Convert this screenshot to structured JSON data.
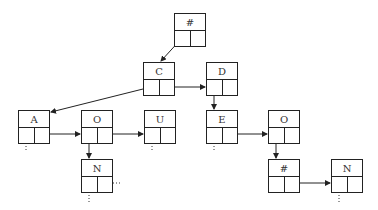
{
  "diagram": {
    "type": "trie-linked-list",
    "nodes": [
      {
        "id": "root",
        "label": "#",
        "x": 174,
        "y": 13,
        "left": "pointer",
        "right": "null"
      },
      {
        "id": "C",
        "label": "C",
        "x": 143,
        "y": 62,
        "left": "pointer",
        "right": "pointer"
      },
      {
        "id": "D",
        "label": "D",
        "x": 206,
        "y": 62,
        "left": "pointer",
        "right": "null"
      },
      {
        "id": "A",
        "label": "A",
        "x": 18,
        "y": 110,
        "left": "dotted",
        "right": "pointer"
      },
      {
        "id": "O1",
        "label": "O",
        "x": 81,
        "y": 110,
        "left": "pointer",
        "right": "pointer"
      },
      {
        "id": "U",
        "label": "U",
        "x": 144,
        "y": 110,
        "left": "dotted",
        "right": "null"
      },
      {
        "id": "E",
        "label": "E",
        "x": 206,
        "y": 110,
        "left": "dotted",
        "right": "pointer"
      },
      {
        "id": "O2",
        "label": "O",
        "x": 268,
        "y": 110,
        "left": "pointer",
        "right": "null"
      },
      {
        "id": "N1",
        "label": "N",
        "x": 81,
        "y": 159,
        "left": "dotted",
        "right": "dotted"
      },
      {
        "id": "hash2",
        "label": "#",
        "x": 268,
        "y": 159,
        "left": "null",
        "right": "pointer"
      },
      {
        "id": "N2",
        "label": "N",
        "x": 331,
        "y": 159,
        "left": "dotted",
        "right": "null"
      }
    ],
    "labels": {
      "root": "#",
      "C": "C",
      "D": "D",
      "A": "A",
      "O1": "O",
      "U": "U",
      "E": "E",
      "O2": "O",
      "N1": "N",
      "hash2": "#",
      "N2": "N"
    },
    "edges": [
      {
        "from": "root",
        "to": "C",
        "type": "child"
      },
      {
        "from": "C",
        "to": "A",
        "type": "child"
      },
      {
        "from": "C",
        "to": "D",
        "type": "sibling"
      },
      {
        "from": "D",
        "to": "E",
        "type": "child"
      },
      {
        "from": "A",
        "to": "O1",
        "type": "sibling"
      },
      {
        "from": "O1",
        "to": "U",
        "type": "sibling"
      },
      {
        "from": "O1",
        "to": "N1",
        "type": "child"
      },
      {
        "from": "E",
        "to": "O2",
        "type": "sibling"
      },
      {
        "from": "O2",
        "to": "hash2",
        "type": "child"
      },
      {
        "from": "hash2",
        "to": "N2",
        "type": "sibling"
      }
    ],
    "colors": {
      "line": "#222222",
      "text": "#333333",
      "background": "#ffffff"
    }
  }
}
